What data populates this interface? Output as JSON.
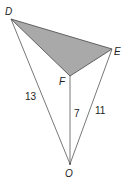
{
  "diagram": {
    "type": "geometry-figure",
    "points": {
      "D": {
        "label": "D",
        "x": 11,
        "y": 19
      },
      "E": {
        "label": "E",
        "x": 112,
        "y": 49
      },
      "F": {
        "label": "F",
        "x": 70,
        "y": 76
      },
      "O": {
        "label": "O",
        "x": 70,
        "y": 164
      }
    },
    "shaded_triangle": [
      "D",
      "E",
      "F"
    ],
    "segments": [
      {
        "from": "D",
        "to": "O",
        "length_label": "13"
      },
      {
        "from": "F",
        "to": "O",
        "length_label": "7"
      },
      {
        "from": "E",
        "to": "O",
        "length_label": "11"
      }
    ],
    "colors": {
      "shade": "#a9a9a9",
      "line": "#555555",
      "text": "#222222"
    }
  }
}
